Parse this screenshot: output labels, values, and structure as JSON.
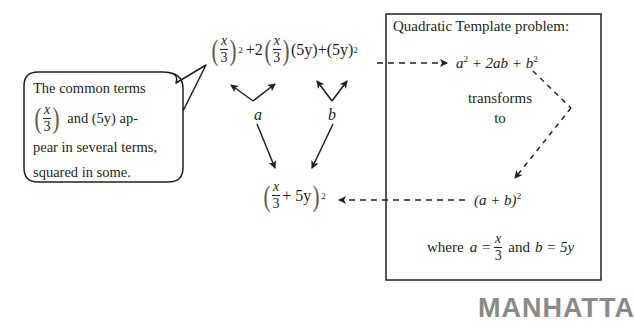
{
  "callout": {
    "line1": "The common terms",
    "frac_num": "x",
    "frac_den": "3",
    "line2_rest": "and (5y) ap-",
    "line3": "pear in several terms,",
    "line4": "squared in some."
  },
  "top_expression": {
    "t1_num": "x",
    "t1_den": "3",
    "t1_exp": "2",
    "plus1": "+",
    "coef": "2",
    "t2_num": "x",
    "t2_den": "3",
    "t3": "(5y)",
    "plus2": "+",
    "t4": "(5y)",
    "t4_exp": "2"
  },
  "labels": {
    "a": "a",
    "b": "b"
  },
  "bottom_expression": {
    "num": "x",
    "den": "3",
    "rest": "+ 5y",
    "exp": "2"
  },
  "template_box": {
    "title": "Quadratic Template problem:",
    "expansion": {
      "a": "a",
      "a_exp": "2",
      "mid": "+ 2ab +",
      "b": "b",
      "b_exp": "2"
    },
    "transforms": "transforms",
    "to": "to",
    "factored": {
      "text": "(a + b)",
      "exp": "2"
    },
    "where": {
      "prefix": "where",
      "a_eq": "a =",
      "num": "x",
      "den": "3",
      "and": "and",
      "b_eq": "b = 5y"
    }
  },
  "logo": {
    "text": "MANHATTA"
  },
  "colors": {
    "ink": "#231f20",
    "logo": "#8a8a8a",
    "background": "#ffffff"
  }
}
